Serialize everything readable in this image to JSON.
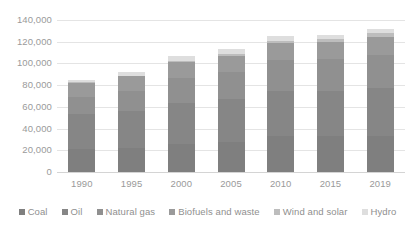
{
  "chart_data": {
    "type": "bar",
    "stacked": true,
    "title": "",
    "subtitle": "",
    "xlabel": "",
    "ylabel": "",
    "ylim": [
      0,
      140000
    ],
    "ytick_step": 20000,
    "ytick_labels": [
      "140,000",
      "120,000",
      "100,000",
      "80,000",
      "60,000",
      "40,000",
      "20,000",
      "0"
    ],
    "ytick_values": [
      140000,
      120000,
      100000,
      80000,
      60000,
      40000,
      20000,
      0
    ],
    "grid": true,
    "grid_axis": "y",
    "legend_position": "bottom",
    "categories": [
      "1990",
      "1995",
      "2000",
      "2005",
      "2010",
      "2015",
      "2019"
    ],
    "totals": [
      85000,
      92000,
      107000,
      113000,
      125000,
      126000,
      132000
    ],
    "series": [
      {
        "name": "Coal",
        "color": "#7f7f7f",
        "values": [
          21000,
          22500,
          25500,
          28000,
          33500,
          33000,
          33500
        ]
      },
      {
        "name": "Oil",
        "color": "#868686",
        "values": [
          32000,
          33500,
          38000,
          39500,
          41500,
          42000,
          43500
        ]
      },
      {
        "name": "Natural gas",
        "color": "#909090",
        "values": [
          16500,
          19000,
          23000,
          25000,
          28000,
          29000,
          31000
        ]
      },
      {
        "name": "Biofuels and waste",
        "color": "#9a9a9a",
        "values": [
          12500,
          13000,
          14500,
          14500,
          15500,
          15500,
          16000
        ]
      },
      {
        "name": "Wind and solar",
        "color": "#bdbdbd",
        "values": [
          500,
          700,
          1200,
          2000,
          2500,
          3000,
          4000
        ]
      },
      {
        "name": "Hydro",
        "color": "#dedede",
        "values": [
          2500,
          3300,
          4800,
          4000,
          4000,
          3500,
          4000
        ]
      }
    ]
  },
  "legend": {
    "items": [
      {
        "label": "Coal"
      },
      {
        "label": "Oil"
      },
      {
        "label": "Natural gas"
      },
      {
        "label": "Biofuels and waste"
      },
      {
        "label": "Wind and solar"
      },
      {
        "label": "Hydro"
      }
    ]
  },
  "colors": {
    "background": "#ffffff",
    "gridline": "#e4e4e4",
    "axis": "#d4d4d4",
    "text": "#9a9a9a"
  }
}
